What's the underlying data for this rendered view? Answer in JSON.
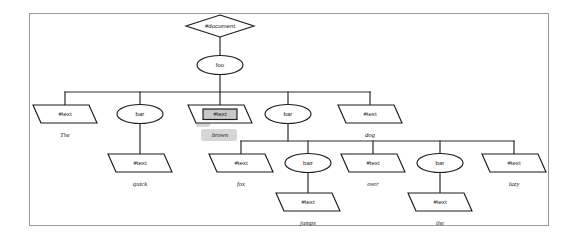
{
  "diagram": {
    "root": {
      "id": "document",
      "shape": "diamond",
      "text": "#document"
    },
    "nodes": [
      {
        "id": "document",
        "shape": "diamond",
        "text": "#document",
        "label": "",
        "x": 220,
        "y": 26,
        "w": 68,
        "h": 22,
        "highlighted": false
      },
      {
        "id": "foo",
        "shape": "ellipse",
        "text": "foo",
        "label": "",
        "x": 220,
        "y": 65,
        "w": 46,
        "h": 19,
        "highlighted": false
      },
      {
        "id": "text-the",
        "shape": "parallelogram",
        "text": "#text",
        "label": "The",
        "x": 65,
        "y": 114,
        "w": 56,
        "h": 18,
        "highlighted": false
      },
      {
        "id": "bar-1",
        "shape": "ellipse",
        "text": "bar",
        "label": "",
        "x": 140,
        "y": 114,
        "w": 46,
        "h": 19,
        "highlighted": false
      },
      {
        "id": "text-brown",
        "shape": "parallelogram",
        "text": "#text",
        "label": "brown",
        "x": 220,
        "y": 114,
        "w": 56,
        "h": 18,
        "highlighted": true
      },
      {
        "id": "bar-2",
        "shape": "ellipse",
        "text": "bar",
        "label": "",
        "x": 288,
        "y": 114,
        "w": 46,
        "h": 19,
        "highlighted": false
      },
      {
        "id": "text-dog",
        "shape": "parallelogram",
        "text": "#text",
        "label": "dog",
        "x": 370,
        "y": 114,
        "w": 56,
        "h": 18,
        "highlighted": false
      },
      {
        "id": "text-quick",
        "shape": "parallelogram",
        "text": "#text",
        "label": "quick",
        "x": 140,
        "y": 163,
        "w": 56,
        "h": 18,
        "highlighted": false
      },
      {
        "id": "text-fox",
        "shape": "parallelogram",
        "text": "#text",
        "label": "fox",
        "x": 241,
        "y": 163,
        "w": 56,
        "h": 18,
        "highlighted": false
      },
      {
        "id": "baz",
        "shape": "ellipse",
        "text": "baz",
        "label": "",
        "x": 308,
        "y": 163,
        "w": 46,
        "h": 19,
        "highlighted": false
      },
      {
        "id": "text-over",
        "shape": "parallelogram",
        "text": "#text",
        "label": "over",
        "x": 373,
        "y": 163,
        "w": 56,
        "h": 18,
        "highlighted": false
      },
      {
        "id": "bar-3",
        "shape": "ellipse",
        "text": "bar",
        "label": "",
        "x": 440,
        "y": 163,
        "w": 46,
        "h": 19,
        "highlighted": false
      },
      {
        "id": "text-lazy",
        "shape": "parallelogram",
        "text": "#text",
        "label": "lazy",
        "x": 514,
        "y": 163,
        "w": 56,
        "h": 18,
        "highlighted": false
      },
      {
        "id": "text-jumps",
        "shape": "parallelogram",
        "text": "#text",
        "label": "jumps",
        "x": 308,
        "y": 202,
        "w": 56,
        "h": 18,
        "highlighted": false
      },
      {
        "id": "text-the2",
        "shape": "parallelogram",
        "text": "#text",
        "label": "the",
        "x": 440,
        "y": 202,
        "w": 56,
        "h": 18,
        "highlighted": false
      }
    ],
    "sentence": [
      "The",
      "quick",
      "brown",
      "fox",
      "jumps",
      "over",
      "the",
      "lazy",
      "dog"
    ],
    "selection": {
      "node_id": "text-brown",
      "text": "#text",
      "label": "brown"
    },
    "colors": {
      "frame_border": "#9a9a9a",
      "node_stroke": "#1b1b1b",
      "node_fill": "#ffffff",
      "edge": "#2b2b2b",
      "highlight_fill": "#c8c8c8",
      "background": "#ffffff"
    }
  },
  "labels": {
    "document": "#document",
    "foo": "foo",
    "bar": "bar",
    "baz": "baz",
    "text": "#text",
    "the": "The",
    "quick": "quick",
    "brown": "brown",
    "fox": "fox",
    "jumps": "jumps",
    "over": "over",
    "the2": "the",
    "lazy": "lazy",
    "dog": "dog"
  }
}
